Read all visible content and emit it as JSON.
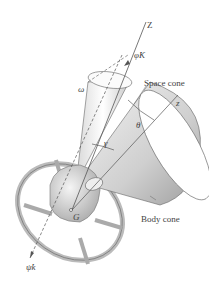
{
  "diagram": {
    "labels": {
      "z_axis": "Z",
      "z_body": "z",
      "precession": "φ̇K",
      "spin": "ψ̇k",
      "omega": "ω",
      "theta": "θ",
      "gamma": "γ",
      "center": "G",
      "space_cone": "Space cone",
      "body_cone": "Body cone"
    },
    "colors": {
      "line": "#555555",
      "cone_light": "#f2f2f2",
      "cone_dark": "#bdbdbd",
      "text": "#444444"
    }
  }
}
